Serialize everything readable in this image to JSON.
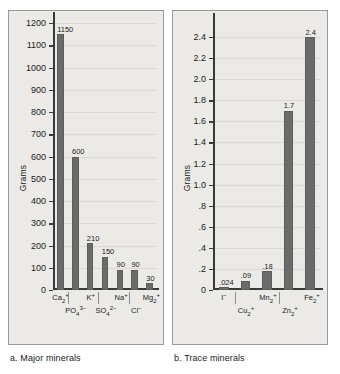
{
  "figure": {
    "y_axis_title": "Grams"
  },
  "panels": [
    {
      "id": "major",
      "caption": "a. Major minerals",
      "chart_data": {
        "type": "bar",
        "title": "a. Major minerals",
        "xlabel": "",
        "ylabel": "Grams",
        "ylim": [
          0,
          1200
        ],
        "ytick_labels": [
          "1200",
          "1100",
          "1000",
          "900",
          "800",
          "700",
          "600",
          "500",
          "400",
          "300",
          "200",
          "100",
          "0"
        ],
        "yticks": [
          1200,
          1100,
          1000,
          900,
          800,
          700,
          600,
          500,
          400,
          300,
          200,
          100,
          0
        ],
        "grid": true,
        "legend": "none",
        "categories": [
          "Ca2+",
          "PO4 3-",
          "K+",
          "SO4 2-",
          "Na+",
          "Cl-",
          "Mg2+"
        ],
        "category_labels": [
          "Ca",
          "PO",
          "K",
          "SO",
          "Na",
          "Cl",
          "Mg"
        ],
        "values": [
          1150,
          600,
          210,
          150,
          90,
          90,
          30
        ],
        "value_labels": [
          "1150",
          "600",
          "210",
          "150",
          "90",
          "90",
          "30"
        ],
        "label_rows": [
          0,
          1,
          0,
          1,
          0,
          1,
          0
        ]
      }
    },
    {
      "id": "trace",
      "caption": "b. Trace minerals",
      "chart_data": {
        "type": "bar",
        "title": "b. Trace minerals",
        "xlabel": "",
        "ylabel": "Grams",
        "ylim": [
          0,
          2.4
        ],
        "ytick_labels": [
          "2.4",
          "2.2",
          "2.0",
          "1.8",
          "1.6",
          "1.4",
          "1.2",
          "1.0",
          ".8",
          ".6",
          ".4",
          ".2",
          "0"
        ],
        "yticks": [
          2.4,
          2.2,
          2.0,
          1.8,
          1.6,
          1.4,
          1.2,
          1.0,
          0.8,
          0.6,
          0.4,
          0.2,
          0
        ],
        "grid": true,
        "legend": "none",
        "categories": [
          "I-",
          "Cu2+",
          "Mn2+",
          "Zn2+",
          "Fe2+"
        ],
        "values": [
          0.024,
          0.09,
          0.18,
          1.7,
          2.4
        ],
        "value_labels": [
          ".024",
          ".09",
          ".18",
          "1.7",
          "2.4"
        ],
        "label_rows": [
          0,
          1,
          0,
          1,
          0
        ]
      }
    }
  ]
}
